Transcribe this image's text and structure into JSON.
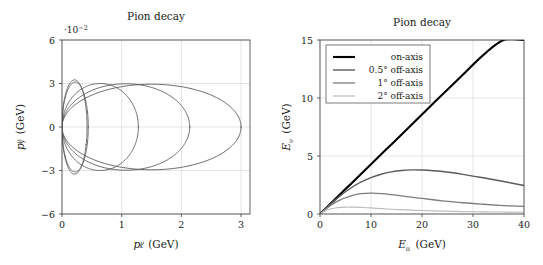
{
  "figure": {
    "panels": [
      "momentum-panel",
      "energy-panel"
    ]
  },
  "left_panel": {
    "title": "Pion decay",
    "multiplier": "·10",
    "multiplier_exp": "−2",
    "xlabel_main": "p",
    "xlabel_sub": "x",
    "xlabel_sup": "ν",
    "xlabel_unit": "(GeV)",
    "ylabel_main": "p",
    "ylabel_sub": "y",
    "ylabel_sup": "ν",
    "ylabel_unit": "(GeV)",
    "xticks": [
      "0",
      "1",
      "2",
      "3"
    ],
    "yticks": [
      "6",
      "3",
      "0",
      "−3",
      "−6"
    ]
  },
  "right_panel": {
    "title": "Pion decay",
    "xlabel_main": "E",
    "xlabel_sub": "π",
    "xlabel_unit": "(GeV)",
    "ylabel_main": "E",
    "ylabel_sub": "ν",
    "ylabel_unit": "(GeV)",
    "xticks": [
      "0",
      "10",
      "20",
      "30",
      "40"
    ],
    "yticks": [
      "0",
      "5",
      "10",
      "15"
    ],
    "legend": [
      {
        "label": "on-axis",
        "color": "#000000",
        "width": 2.1
      },
      {
        "label": "0.5° off-axis",
        "color": "#5a5a5a",
        "width": 1.4
      },
      {
        "label": "1° off-axis",
        "color": "#7d7d7d",
        "width": 1.3
      },
      {
        "label": "2° off-axis",
        "color": "#bdbdbd",
        "width": 1.2
      }
    ]
  },
  "chart_data": [
    {
      "type": "line",
      "name": "neutrino-momentum-ellipses",
      "title": "Pion decay",
      "xlabel": "p_x^nu (GeV)",
      "ylabel": "p_y^nu (GeV)",
      "y_multiplier": "1e-2",
      "xlim": [
        0,
        3.15
      ],
      "ylim": [
        -6,
        6
      ],
      "xticks": [
        0,
        1,
        2,
        3
      ],
      "yticks": [
        -6,
        -3,
        0,
        3,
        6
      ],
      "grid": true,
      "legend": "none",
      "series": [
        {
          "name": "ellipse-1",
          "color": "#5a5a5a",
          "width": 0.9,
          "center_x": 0.21,
          "semi_x": 0.21,
          "semi_y": 3.25,
          "tilt_deg": -22
        },
        {
          "name": "ellipse-2",
          "color": "#5a5a5a",
          "width": 0.9,
          "center_x": 0.22,
          "semi_x": 0.22,
          "semi_y": 3.1,
          "tilt_deg": 0
        },
        {
          "name": "ellipse-3",
          "color": "#5a5a5a",
          "width": 0.9,
          "center_x": 0.64,
          "semi_x": 0.64,
          "semi_y": 3.0,
          "tilt_deg": 0
        },
        {
          "name": "ellipse-4",
          "color": "#5a5a5a",
          "width": 0.9,
          "center_x": 1.07,
          "semi_x": 1.07,
          "semi_y": 2.98,
          "tilt_deg": 0
        },
        {
          "name": "ellipse-5",
          "color": "#5a5a5a",
          "width": 0.9,
          "center_x": 1.5,
          "semi_x": 1.5,
          "semi_y": 2.95,
          "tilt_deg": 0
        }
      ]
    },
    {
      "type": "line",
      "name": "neutrino-energy-vs-pion-energy",
      "title": "Pion decay",
      "xlabel": "E_pi (GeV)",
      "ylabel": "E_nu (GeV)",
      "xlim": [
        0,
        40
      ],
      "ylim": [
        0,
        15
      ],
      "xticks": [
        0,
        10,
        20,
        30,
        40
      ],
      "yticks": [
        0,
        5,
        10,
        15
      ],
      "grid": true,
      "legend": "upper-left",
      "x": [
        0,
        1,
        2,
        3,
        4,
        5,
        6,
        7,
        8,
        10,
        12,
        14,
        16,
        18,
        20,
        24,
        28,
        32,
        36,
        40
      ],
      "series": [
        {
          "name": "on-axis",
          "color": "#000000",
          "width": 2.1,
          "values": [
            0,
            0.43,
            0.86,
            1.29,
            1.72,
            2.15,
            2.57,
            3.0,
            3.43,
            4.29,
            5.15,
            6.0,
            6.86,
            7.72,
            8.58,
            10.3,
            12.0,
            13.7,
            15.0,
            15.0
          ]
        },
        {
          "name": "0.5-deg-off-axis",
          "color": "#5a5a5a",
          "width": 1.4,
          "values": [
            0,
            0.42,
            0.83,
            1.22,
            1.58,
            1.92,
            2.22,
            2.5,
            2.74,
            3.13,
            3.43,
            3.63,
            3.75,
            3.8,
            3.79,
            3.66,
            3.42,
            3.12,
            2.8,
            2.45
          ]
        },
        {
          "name": "1-deg-off-axis",
          "color": "#7d7d7d",
          "width": 1.3,
          "values": [
            0,
            0.39,
            0.72,
            1.0,
            1.22,
            1.4,
            1.55,
            1.67,
            1.75,
            1.8,
            1.76,
            1.67,
            1.56,
            1.45,
            1.34,
            1.14,
            0.97,
            0.84,
            0.73,
            0.65
          ]
        },
        {
          "name": "2-deg-off-axis",
          "color": "#bdbdbd",
          "width": 1.2,
          "values": [
            0,
            0.27,
            0.43,
            0.52,
            0.57,
            0.6,
            0.6,
            0.59,
            0.57,
            0.52,
            0.46,
            0.41,
            0.37,
            0.33,
            0.3,
            0.25,
            0.21,
            0.19,
            0.17,
            0.15
          ]
        }
      ]
    }
  ]
}
